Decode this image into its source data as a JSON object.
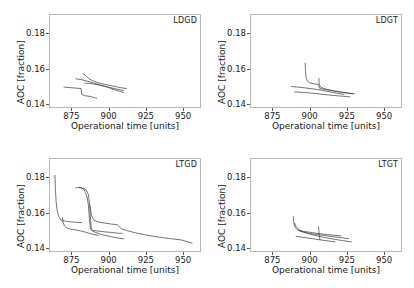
{
  "figure": {
    "width": 414,
    "height": 288,
    "background": "#ffffff",
    "line_color": "#3a3a3a",
    "frame_color": "#b8b8b8"
  },
  "axes": {
    "xlabel": "Operational time [units]",
    "ylabel": "AOC [fraction]",
    "xticks": [
      "875",
      "900",
      "925",
      "950"
    ],
    "xtick_values": [
      875,
      900,
      925,
      950
    ],
    "yticks": [
      "0.14",
      "0.16",
      "0.18"
    ],
    "ytick_values": [
      0.14,
      0.16,
      0.18
    ],
    "xlim": [
      860,
      962
    ],
    "ylim": [
      0.138,
      0.1905
    ],
    "grid": false
  },
  "panels": [
    {
      "id": "ldgd",
      "label": "LDGD"
    },
    {
      "id": "ldgt",
      "label": "LDGT"
    },
    {
      "id": "ltgd",
      "label": "LTGD"
    },
    {
      "id": "ltgt",
      "label": "LTGT"
    }
  ],
  "chart_data": [
    {
      "type": "line",
      "title": "LDGD",
      "xlabel": "Operational time [units]",
      "ylabel": "AOC [fraction]",
      "xlim": [
        860,
        962
      ],
      "ylim": [
        0.138,
        0.1905
      ],
      "grid": false,
      "series": [
        {
          "name": "run-1",
          "x": [
            870.0,
            874.0,
            878.0,
            881.5,
            882.0,
            884.0,
            888.0,
            892.0
          ],
          "y": [
            0.1497,
            0.1494,
            0.1491,
            0.1489,
            0.1455,
            0.1449,
            0.1444,
            0.1434
          ]
        },
        {
          "name": "run-2",
          "x": [
            878.0,
            882.0,
            886.0,
            890.0,
            895.0,
            900.0,
            905.0,
            910.0
          ],
          "y": [
            0.1543,
            0.1538,
            0.1529,
            0.1519,
            0.1507,
            0.1496,
            0.1486,
            0.1478
          ]
        },
        {
          "name": "run-3",
          "x": [
            883.0,
            884.5,
            886.5,
            889.0,
            893.0,
            898.0,
            903.0,
            908.0,
            912.0
          ],
          "y": [
            0.1571,
            0.1561,
            0.1546,
            0.1533,
            0.1521,
            0.1511,
            0.1502,
            0.1494,
            0.1488
          ]
        },
        {
          "name": "run-4",
          "x": [
            884.0,
            887.0,
            890.0,
            894.0,
            899.0,
            903.0,
            907.0,
            910.0
          ],
          "y": [
            0.1519,
            0.1517,
            0.1514,
            0.1507,
            0.1497,
            0.1485,
            0.1474,
            0.1467
          ]
        }
      ]
    },
    {
      "type": "line",
      "title": "LDGT",
      "xlabel": "Operational time [units]",
      "ylabel": "AOC [fraction]",
      "xlim": [
        860,
        962
      ],
      "ylim": [
        0.138,
        0.1905
      ],
      "grid": false,
      "series": [
        {
          "name": "run-1",
          "x": [
            888.0,
            893.0,
            898.0,
            903.0,
            908.0,
            913.0,
            918.0,
            923.0
          ],
          "y": [
            0.15,
            0.1496,
            0.1491,
            0.1486,
            0.1479,
            0.1471,
            0.1463,
            0.1456
          ]
        },
        {
          "name": "run-2",
          "x": [
            890.0,
            895.0,
            900.0,
            905.0,
            910.0,
            916.0,
            922.0,
            927.0
          ],
          "y": [
            0.147,
            0.1467,
            0.1464,
            0.146,
            0.1455,
            0.145,
            0.1446,
            0.1442
          ]
        },
        {
          "name": "run-3",
          "x": [
            897.0,
            897.2,
            897.6,
            898.5,
            900.0,
            903.0,
            906.0,
            906.5,
            906.8,
            910.0,
            915.0,
            920.0,
            926.0,
            930.0
          ],
          "y": [
            0.163,
            0.159,
            0.1552,
            0.1531,
            0.1521,
            0.1515,
            0.1512,
            0.1496,
            0.1489,
            0.1484,
            0.1477,
            0.147,
            0.1463,
            0.1459
          ]
        },
        {
          "name": "run-4",
          "x": [
            906.2,
            906.3,
            906.5,
            907.0,
            909.0,
            913.0,
            918.0,
            924.0,
            929.0
          ],
          "y": [
            0.1546,
            0.153,
            0.1512,
            0.15,
            0.149,
            0.1481,
            0.1473,
            0.1465,
            0.1459
          ]
        }
      ]
    },
    {
      "type": "line",
      "title": "LTGD",
      "xlabel": "Operational time [units]",
      "ylabel": "AOC [fraction]",
      "xlim": [
        860,
        962
      ],
      "ylim": [
        0.138,
        0.1905
      ],
      "grid": false,
      "series": [
        {
          "name": "run-1",
          "x": [
            864.0,
            864.3,
            864.8,
            865.5,
            866.5,
            867.5,
            868.0,
            869.0,
            871.0,
            874.0,
            878.0,
            882.0
          ],
          "y": [
            0.1808,
            0.173,
            0.166,
            0.161,
            0.1578,
            0.1566,
            0.1558,
            0.1555,
            0.1552,
            0.1549,
            0.1546,
            0.1544
          ]
        },
        {
          "name": "run-2",
          "x": [
            869.0,
            869.5,
            870.5,
            872.0,
            874.0,
            877.0,
            880.0,
            884.0,
            888.0,
            893.0
          ],
          "y": [
            0.1572,
            0.1544,
            0.1524,
            0.1514,
            0.1509,
            0.1505,
            0.15,
            0.1492,
            0.1482,
            0.1473
          ]
        },
        {
          "name": "run-3",
          "x": [
            878.0,
            880.0,
            882.0,
            883.5,
            884.5,
            885.5,
            886.3,
            886.8,
            887.2,
            887.6,
            888.0,
            889.0,
            890.0
          ],
          "y": [
            0.1738,
            0.174,
            0.1738,
            0.1728,
            0.1712,
            0.1688,
            0.1652,
            0.16,
            0.1558,
            0.1526,
            0.1508,
            0.15,
            0.1496
          ]
        },
        {
          "name": "run-4",
          "x": [
            880.0,
            883.0,
            885.0,
            886.5,
            887.3,
            887.8,
            888.3,
            889.0,
            891.0,
            894.0,
            898.0,
            903.0,
            907.0,
            910.0
          ],
          "y": [
            0.1742,
            0.1736,
            0.1726,
            0.17,
            0.164,
            0.157,
            0.152,
            0.15,
            0.149,
            0.1481,
            0.1472,
            0.1463,
            0.1457,
            0.1454
          ]
        },
        {
          "name": "run-5",
          "x": [
            887.5,
            888.5,
            890.0,
            893.0,
            897.0,
            902.0,
            906.0,
            907.5,
            908.5,
            912.0,
            918.0,
            925.0,
            933.0,
            941.0,
            949.0,
            956.0
          ],
          "y": [
            0.164,
            0.1585,
            0.1558,
            0.1548,
            0.1542,
            0.1536,
            0.1532,
            0.1518,
            0.151,
            0.15,
            0.1487,
            0.1475,
            0.1464,
            0.1455,
            0.1447,
            0.143
          ]
        },
        {
          "name": "run-6",
          "x": [
            890.0,
            893.0,
            897.0,
            902.0,
            906.0,
            909.0
          ],
          "y": [
            0.15,
            0.1497,
            0.1493,
            0.1489,
            0.1485,
            0.1484
          ]
        }
      ]
    },
    {
      "type": "line",
      "title": "LTGT",
      "xlabel": "Operational time [units]",
      "ylabel": "AOC [fraction]",
      "xlim": [
        860,
        962
      ],
      "ylim": [
        0.138,
        0.1905
      ],
      "grid": false,
      "series": [
        {
          "name": "run-1",
          "x": [
            889.0,
            889.3,
            890.0,
            891.5,
            894.0,
            898.0,
            903.0,
            909.0,
            915.0,
            921.0,
            926.0
          ],
          "y": [
            0.1578,
            0.1548,
            0.1522,
            0.1506,
            0.1495,
            0.1487,
            0.148,
            0.1473,
            0.1466,
            0.146,
            0.1455
          ]
        },
        {
          "name": "run-2",
          "x": [
            890.0,
            891.0,
            893.0,
            896.0,
            900.0,
            905.0,
            910.0,
            916.0,
            922.0,
            928.0
          ],
          "y": [
            0.154,
            0.1522,
            0.1504,
            0.1491,
            0.148,
            0.147,
            0.1461,
            0.1452,
            0.1444,
            0.1436
          ]
        },
        {
          "name": "run-3",
          "x": [
            893.0,
            897.0,
            902.0,
            907.0,
            912.0,
            917.0,
            921.0
          ],
          "y": [
            0.1499,
            0.1494,
            0.1488,
            0.1482,
            0.1477,
            0.1473,
            0.147
          ]
        },
        {
          "name": "run-4",
          "x": [
            891.0,
            894.0,
            898.0,
            903.0,
            908.0,
            913.0,
            917.0
          ],
          "y": [
            0.1468,
            0.1464,
            0.1459,
            0.1453,
            0.1447,
            0.1441,
            0.1437
          ]
        },
        {
          "name": "run-5",
          "x": [
            906.0,
            906.2,
            906.5,
            907.0
          ],
          "y": [
            0.152,
            0.15,
            0.147,
            0.1448
          ]
        }
      ]
    }
  ]
}
